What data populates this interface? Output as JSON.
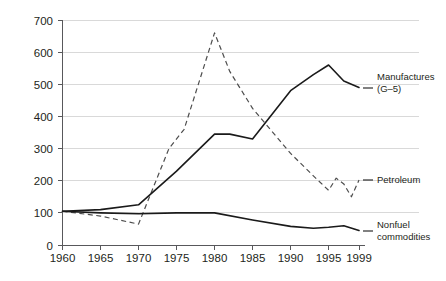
{
  "chart_data": {
    "type": "line",
    "title": "",
    "subtitle": "",
    "xlabel": "",
    "ylabel": "",
    "xlim": [
      1960,
      1999
    ],
    "ylim": [
      0,
      700
    ],
    "grid": true,
    "legend_position": "right-inline-labels",
    "y_ticks": [
      0,
      100,
      200,
      300,
      400,
      500,
      600,
      700
    ],
    "y_tick_labels": [
      "0",
      "100",
      "200",
      "300",
      "400",
      "500",
      "600",
      "700"
    ],
    "x_ticks": [
      1960,
      1965,
      1970,
      1975,
      1980,
      1985,
      1990,
      1995,
      1999
    ],
    "x_tick_labels": [
      "1960",
      "1965",
      "1970",
      "1975",
      "1980",
      "1985",
      "1990",
      "1995",
      "1999"
    ],
    "series": [
      {
        "name": "Manufactures (G-5)",
        "style": "solid",
        "color": "#1a1a1a",
        "label_lines": [
          "Manufactures",
          "(G–5)"
        ],
        "x": [
          1960,
          1965,
          1970,
          1975,
          1980,
          1982,
          1985,
          1990,
          1993,
          1995,
          1997,
          1999
        ],
        "values": [
          105,
          110,
          125,
          230,
          345,
          345,
          330,
          480,
          530,
          560,
          510,
          490
        ]
      },
      {
        "name": "Petroleum",
        "style": "dashed",
        "color": "#4d4d4d",
        "label_lines": [
          "Petroleum"
        ],
        "x": [
          1960,
          1965,
          1970,
          1974,
          1976,
          1980,
          1982,
          1985,
          1990,
          1993,
          1995,
          1996,
          1997,
          1998,
          1999
        ],
        "values": [
          105,
          90,
          65,
          300,
          360,
          660,
          540,
          425,
          285,
          215,
          170,
          208,
          190,
          150,
          202
        ]
      },
      {
        "name": "Nonfuel commodities",
        "style": "solid",
        "color": "#1a1a1a",
        "label_lines": [
          "Nonfuel",
          "commodities"
        ],
        "x": [
          1960,
          1965,
          1970,
          1975,
          1980,
          1985,
          1990,
          1993,
          1995,
          1997,
          1999
        ],
        "values": [
          105,
          100,
          97,
          100,
          100,
          78,
          58,
          52,
          55,
          60,
          45
        ]
      }
    ]
  },
  "labels": {
    "manufactures_line1": "Manufactures",
    "manufactures_line2": "(G–5)",
    "petroleum": "Petroleum",
    "nonfuel_line1": "Nonfuel",
    "nonfuel_line2": "commodities"
  },
  "y_axis": {
    "t0": "0",
    "t1": "100",
    "t2": "200",
    "t3": "300",
    "t4": "400",
    "t5": "500",
    "t6": "600",
    "t7": "700"
  },
  "x_axis": {
    "t0": "1960",
    "t1": "1965",
    "t2": "1970",
    "t3": "1975",
    "t4": "1980",
    "t5": "1985",
    "t6": "1990",
    "t7": "1995",
    "t8": "1999"
  }
}
